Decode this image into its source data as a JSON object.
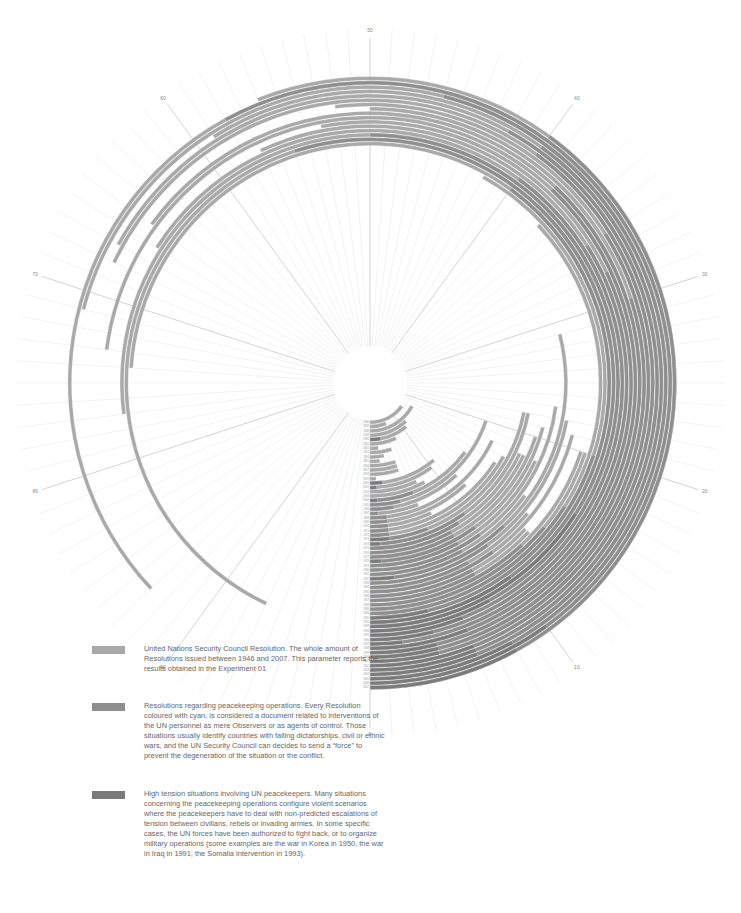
{
  "chart_data": {
    "type": "radial-bar",
    "title": "",
    "angular_axis": {
      "ticks": [
        0,
        10,
        20,
        30,
        40,
        50,
        60,
        70,
        80,
        90
      ],
      "max": 100
    },
    "years": [
      1946,
      1947,
      1948,
      1949,
      1950,
      1951,
      1952,
      1953,
      1954,
      1955,
      1956,
      1957,
      1958,
      1959,
      1960,
      1961,
      1962,
      1963,
      1964,
      1965,
      1966,
      1967,
      1968,
      1969,
      1970,
      1971,
      1972,
      1973,
      1974,
      1975,
      1976,
      1977,
      1978,
      1979,
      1980,
      1981,
      1982,
      1983,
      1984,
      1985,
      1986,
      1987,
      1988,
      1989,
      1990,
      1991,
      1992,
      1993,
      1994,
      1995,
      1996,
      1997,
      1998,
      1999,
      2000,
      2001,
      2002,
      2003,
      2004,
      2005,
      2006,
      2007
    ],
    "series": [
      {
        "name": "United Nations Security Council Resolutions",
        "color": "#a9a9a9",
        "values": [
          15,
          6,
          17,
          12,
          11,
          7,
          2,
          5,
          3,
          2,
          5,
          5,
          5,
          1,
          11,
          10,
          7,
          8,
          15,
          20,
          12,
          6,
          18,
          12,
          7,
          16,
          17,
          22,
          22,
          18,
          18,
          20,
          21,
          18,
          23,
          15,
          29,
          22,
          14,
          21,
          13,
          13,
          20,
          20,
          37,
          42,
          74,
          93,
          77,
          66,
          57,
          53,
          73,
          65,
          50,
          52,
          68,
          67,
          59,
          71,
          87,
          56
        ]
      },
      {
        "name": "Resolutions regarding peacekeeping operations",
        "color": "#8e8e8e",
        "values": [
          0,
          0,
          0,
          0,
          0,
          0,
          0,
          0,
          0,
          0,
          0,
          0,
          0,
          0,
          0,
          0,
          0,
          0,
          6,
          4,
          3,
          1,
          2,
          2,
          2,
          2,
          2,
          6,
          10,
          9,
          8,
          8,
          10,
          8,
          10,
          8,
          12,
          10,
          8,
          10,
          8,
          8,
          12,
          14,
          16,
          20,
          40,
          55,
          50,
          40,
          34,
          32,
          38,
          38,
          30,
          34,
          40,
          42,
          40,
          46,
          58,
          40
        ]
      },
      {
        "name": "High tension situations involving UN peacekeepers",
        "color": "#7b7b7b",
        "values": [
          0,
          0,
          0,
          0,
          3,
          0,
          0,
          0,
          0,
          0,
          0,
          0,
          0,
          0,
          2,
          1,
          0,
          0,
          1,
          0,
          0,
          0,
          0,
          0,
          0,
          0,
          0,
          2,
          1,
          0,
          0,
          0,
          1,
          0,
          0,
          0,
          2,
          0,
          0,
          0,
          0,
          0,
          0,
          0,
          0,
          4,
          10,
          16,
          8,
          6,
          4,
          2,
          6,
          4,
          4,
          4,
          6,
          6,
          6,
          8,
          10,
          8
        ]
      }
    ],
    "legend_position": "bottom-left"
  },
  "legend": {
    "items": [
      {
        "text": "United Nations Security Council Resolution. The whole amount of Resolutions issued between 1946 and 2007. This parameter reports the results obtained in the Experiment 01",
        "color": "#a9a9a9"
      },
      {
        "text": "Resolutions regarding peacekeeping operations. Every Resolution coloured with cyan, is considered a document related to interventions of the UN personnel as mere Observers or as agents of control. Those situations usually identify countries with falling dictatorships, civil or ethnic wars, and the UN Security Council can decides to send a “force” to prevent the degeneration of the situation or the conflict.",
        "color": "#8e8e8e"
      },
      {
        "text": "High tension situations involving UN peacekeepers. Many situations concerning the peacekeeping operations configure violent scenarios where the peacekeepers have to deal with non-predicted escalations of tension between civilians, rebels or invading armies. In some specific cases, the UN forces have been authorized to fight back, or to organize military operations (some examples are the war in Korea in 1950, the war in Iraq in 1991, the Somalia intervention in 1993).",
        "color": "#7b7b7b"
      }
    ]
  }
}
